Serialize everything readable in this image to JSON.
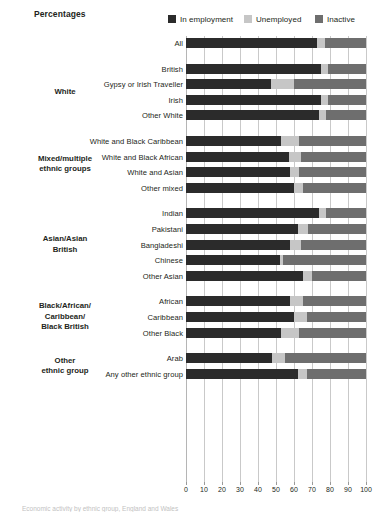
{
  "header": {
    "title": "Percentages"
  },
  "legend": {
    "position": "top-right",
    "items": [
      {
        "label": "In employment",
        "color": "#2b2b2b",
        "icon": "legend-swatch-icon"
      },
      {
        "label": "Unemployed",
        "color": "#c6c6c6",
        "icon": "legend-swatch-icon"
      },
      {
        "label": "Inactive",
        "color": "#6e6e6e",
        "icon": "legend-swatch-icon"
      }
    ]
  },
  "caption": "Economic activity by ethnic group, England and Wales",
  "groups": [
    {
      "label": "",
      "rows": 1
    },
    {
      "label": "White",
      "rows": 4
    },
    {
      "label": "Mixed/multiple\nethnic groups",
      "rows": 4
    },
    {
      "label": "Asian/Asian\nBritish",
      "rows": 5
    },
    {
      "label": "Black/African/\nCaribbean/\nBlack British",
      "rows": 3
    },
    {
      "label": "Other\nethnic group",
      "rows": 2
    }
  ],
  "chart_data": {
    "type": "bar",
    "orientation": "horizontal",
    "stacked": true,
    "title": "Percentages",
    "xlabel": "",
    "ylabel": "",
    "xlim": [
      0,
      100
    ],
    "xticks": [
      0,
      10,
      20,
      30,
      40,
      50,
      60,
      70,
      80,
      90,
      100
    ],
    "grid": true,
    "legend_position": "top-right",
    "categories": [
      "All",
      "British",
      "Gypsy or Irish Traveller",
      "Irish",
      "Other White",
      "White and Black Caribbean",
      "White and Black African",
      "White and Asian",
      "Other mixed",
      "Indian",
      "Pakistani",
      "Bangladeshi",
      "Chinese",
      "Other Asian",
      "African",
      "Caribbean",
      "Other Black",
      "Arab",
      "Any other ethnic group"
    ],
    "series": [
      {
        "name": "In employment",
        "color": "#2b2b2b",
        "values": [
          73,
          75,
          47,
          75,
          74,
          53,
          57,
          58,
          60,
          74,
          62,
          58,
          52,
          65,
          58,
          60,
          53,
          48,
          62
        ]
      },
      {
        "name": "Unemployed",
        "color": "#c6c6c6",
        "values": [
          4,
          4,
          13,
          4,
          4,
          10,
          7,
          5,
          5,
          4,
          6,
          6,
          2,
          5,
          7,
          7,
          10,
          7,
          5
        ]
      },
      {
        "name": "Inactive",
        "color": "#6e6e6e",
        "values": [
          23,
          21,
          40,
          21,
          22,
          37,
          36,
          37,
          35,
          22,
          32,
          36,
          46,
          30,
          35,
          33,
          37,
          45,
          33
        ]
      }
    ]
  }
}
